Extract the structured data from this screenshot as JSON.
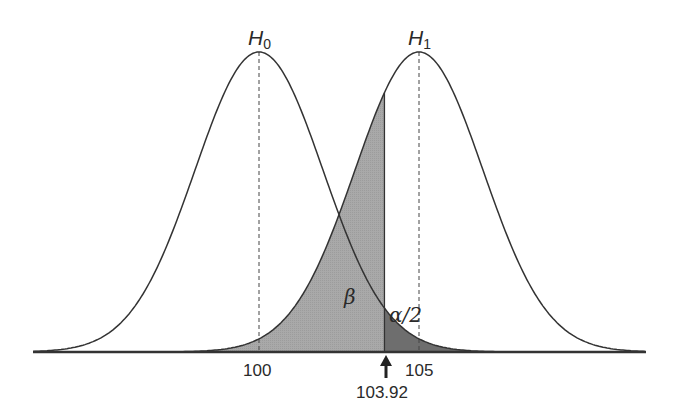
{
  "diagram": {
    "title": "",
    "curves": [
      {
        "id": "h0",
        "label_main": "H",
        "label_sub": "0",
        "mean": 100,
        "sd": 2
      },
      {
        "id": "h1",
        "label_main": "H",
        "label_sub": "1",
        "mean": 105,
        "sd": 2
      }
    ],
    "critical_value": "103.92",
    "tick_labels": [
      "100",
      "105"
    ],
    "region_labels": {
      "beta": "β",
      "alpha_half": "α/2"
    },
    "colors": {
      "curve": "#333333",
      "beta_fill": "#a9a9a9",
      "alpha_fill": "#6e6e6e",
      "background": "#ffffff"
    }
  }
}
